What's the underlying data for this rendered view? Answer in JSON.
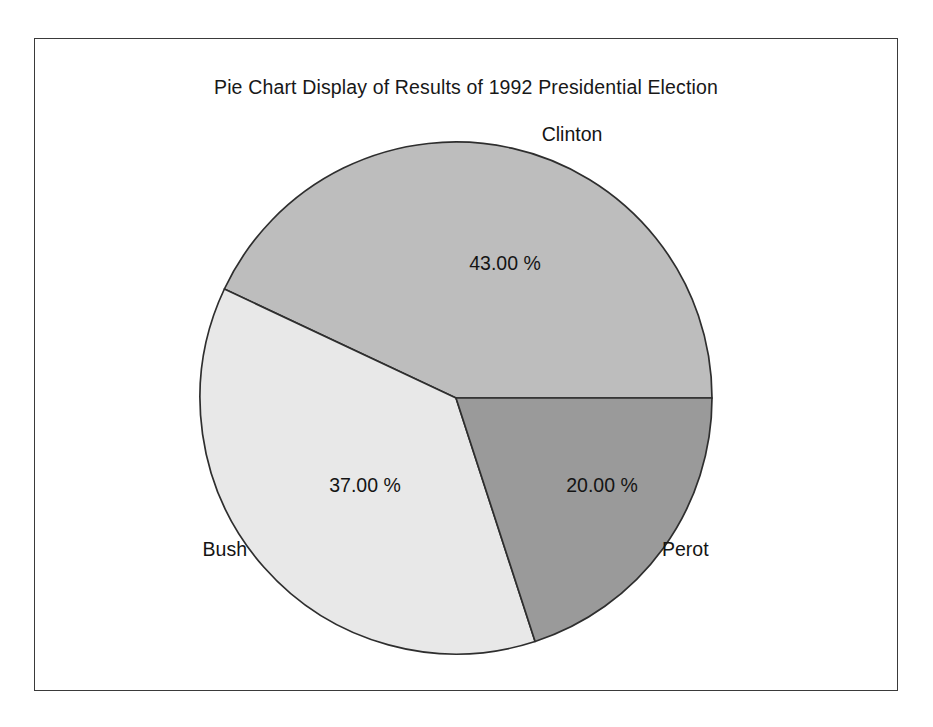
{
  "chart_data": {
    "type": "pie",
    "title": "Pie Chart Display of Results of 1992 Presidential Election",
    "xlabel": "",
    "ylabel": "",
    "categories": [
      "Clinton",
      "Bush",
      "Perot"
    ],
    "values": [
      43.0,
      37.0,
      20.0
    ],
    "value_labels": [
      "43.00 %",
      "37.00 %",
      "20.00 %"
    ],
    "units": "percent",
    "legend": "none",
    "grid": false,
    "direction": "counterclockwise",
    "start_angle_deg": 0,
    "slices": [
      {
        "name": "Clinton",
        "value": 43.0,
        "value_label": "43.00 %",
        "color": "#bdbdbd",
        "start_deg": 0,
        "end_deg": 154.8,
        "label_position": "outside-top-right"
      },
      {
        "name": "Bush",
        "value": 37.0,
        "value_label": "37.00 %",
        "color": "#e8e8e8",
        "start_deg": 154.8,
        "end_deg": 288.0,
        "label_position": "outside-left"
      },
      {
        "name": "Perot",
        "value": 20.0,
        "value_label": "20.00 %",
        "color": "#9a9a9a",
        "start_deg": 288.0,
        "end_deg": 360.0,
        "label_position": "outside-right"
      }
    ],
    "colors": {
      "clinton": "#bdbdbd",
      "bush": "#e8e8e8",
      "perot": "#9a9a9a",
      "outline": "#2e2e2e",
      "frame": "#3a3a3a",
      "background": "#ffffff",
      "text": "#141414"
    }
  }
}
